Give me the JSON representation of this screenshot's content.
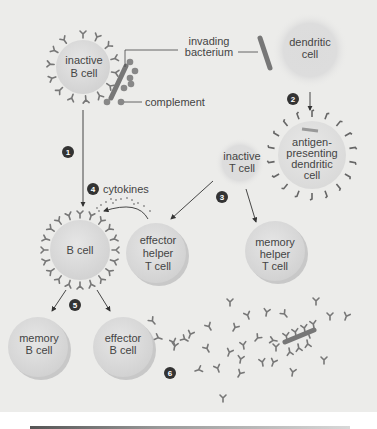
{
  "figure": {
    "title": "",
    "colors": {
      "background": "#ececea",
      "cell_fill": "#dcdcdc",
      "receptor": "#777777",
      "bacterium": "#777777",
      "complement": "#888888",
      "step_badge": "#333333",
      "line": "#444444"
    }
  },
  "labels": {
    "inactive_b_cell": [
      "inactive",
      "B cell"
    ],
    "invading_bacterium": [
      "invading",
      "bacterium"
    ],
    "complement": "complement",
    "dendritic_cell": [
      "dendritic",
      "cell"
    ],
    "antigen_presenting": [
      "antigen-",
      "presenting",
      "dendritic",
      "cell"
    ],
    "inactive_t_cell": [
      "inactive",
      "T cell"
    ],
    "cytokines": "cytokines",
    "b_cell": "B cell",
    "effector_helper_t": [
      "effector",
      "helper",
      "T cell"
    ],
    "memory_helper_t": [
      "memory",
      "helper",
      "T cell"
    ],
    "memory_b_cell": [
      "memory",
      "B cell"
    ],
    "effector_b_cell": [
      "effector",
      "B cell"
    ]
  },
  "steps": [
    "1",
    "2",
    "3",
    "4",
    "5",
    "6"
  ]
}
